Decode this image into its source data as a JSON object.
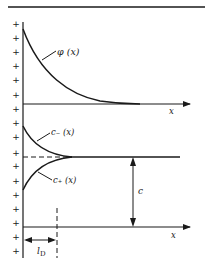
{
  "diagram": {
    "title": "",
    "top_plot": {
      "curve_label": "φ (x)",
      "x_axis_label": "x"
    },
    "bottom_plot": {
      "upper_curve_label": "c₋ (x)",
      "lower_curve_label": "c₊ (x)",
      "bulk_label": "c",
      "x_axis_label": "x",
      "length_label": "l",
      "length_subscript": "D"
    },
    "surface_charge_symbol": "+",
    "surface_charge_count": 17,
    "colors": {
      "ink": "#1a1a1a",
      "background": "#ffffff"
    }
  }
}
